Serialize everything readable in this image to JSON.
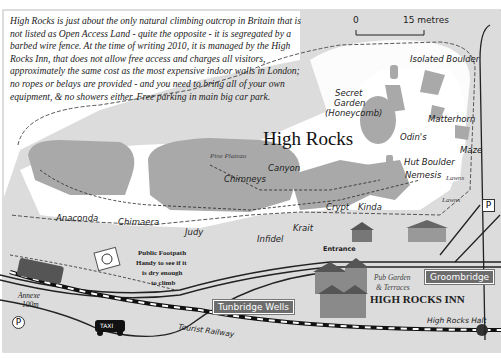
{
  "intro_text": "High Rocks is just about the only natural climbing outcrop in Britain that is not listed as Open Access Land - quite the opposite - it is segregated by a barbed wire fence. At the time of writing 2010, it is managed by the High Rocks Inn, that does not allow free access and charges all visitors, approximately the same cost as the most expensive indoor walls in London; no ropes or belays are provided - and you need to bring all of your own equipment, & no showers either. Free parking in main big car park.",
  "scale_bar": {
    "start": "0",
    "end": "15 metres"
  },
  "title": "High Rocks",
  "areas": {
    "pine_plateau": "Pine Plateau",
    "lawns_1": "Lawns",
    "lawns_2": "Lawns"
  },
  "routes": {
    "isolated_boulder": "Isolated Boulder",
    "secret_garden": "Secret",
    "secret_garden_2": "Garden",
    "secret_garden_3": "(Honeycomb)",
    "matterhorn": "Matterhorn",
    "odins": "Odin's",
    "maze": "Maze",
    "hut_boulder": "Hut Boulder",
    "nemesis": "Nemesis",
    "canyon": "Canyon",
    "chimneys": "Chimneys",
    "crypt": "Crypt",
    "kinda": "Kinda",
    "anaconda": "Anaconda",
    "chimaera": "Chimaera",
    "judy": "Judy",
    "infidel": "Infidel",
    "krait": "Krait"
  },
  "places": {
    "entrance": "Entrance",
    "footpath_1": "Public Footpath",
    "footpath_2": "Handy to see if it",
    "footpath_3": "is dry enough",
    "footpath_4": "to climb",
    "pub_garden_1": "Pub Garden",
    "pub_garden_2": "& Terraces",
    "inn": "HIGH ROCKS INN",
    "annexe_1": "Annexe",
    "annexe_2": "100m",
    "railway": "Tourist Railway",
    "halt": "High Rocks Halt",
    "taxi": "TAXI",
    "parking": "P"
  },
  "signs": {
    "groombridge": "Groombridge",
    "tunbridge": "Tunbridge Wells"
  },
  "colors": {
    "land": "#dcdcdc",
    "rock": "#a9a9a9",
    "clearing": "#ffffff",
    "road": "#222222",
    "sign": "#6d6d6d"
  }
}
